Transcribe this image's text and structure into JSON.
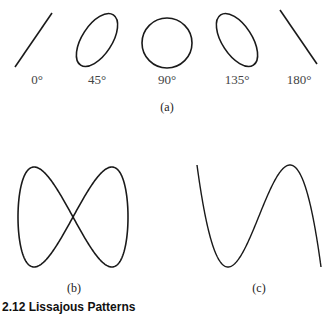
{
  "figure": {
    "row_a": {
      "items": [
        {
          "label": "0°",
          "shape": "line-positive-slope"
        },
        {
          "label": "45°",
          "shape": "ellipse-tilted-right"
        },
        {
          "label": "90°",
          "shape": "circle"
        },
        {
          "label": "135°",
          "shape": "ellipse-tilted-left"
        },
        {
          "label": "180°",
          "shape": "line-negative-slope"
        }
      ],
      "sublabel": "(a)"
    },
    "panel_b": {
      "sublabel": "(b)",
      "shape": "lissajous-1-2-figure-eight"
    },
    "panel_c": {
      "sublabel": "(c)",
      "shape": "lissajous-1-3"
    },
    "caption": "2.12  Lissajous Patterns",
    "stroke_color": "#1a1a1a"
  }
}
